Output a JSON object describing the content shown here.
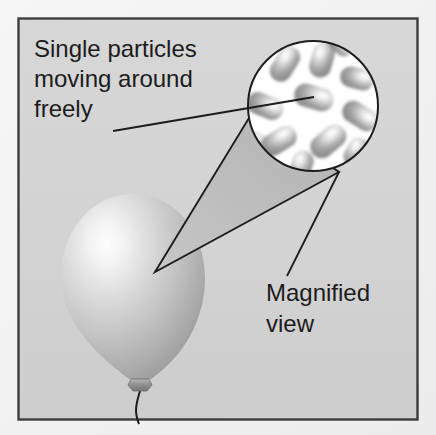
{
  "figure": {
    "background_color": "#f2f2f2",
    "panel_color": "#d4d4d4",
    "border_color": "#3a3a3a",
    "line_color": "#1c1c1c",
    "panel": {
      "x": 18,
      "y": 18,
      "width": 400,
      "height": 402
    }
  },
  "labels": {
    "particles": {
      "name": "particles-caption",
      "lines": [
        "Single particles",
        "moving around",
        "freely"
      ],
      "x": 34,
      "y": 57,
      "font_size": 24,
      "line_height": 30
    },
    "magnified": {
      "name": "magnified-view-caption",
      "lines": [
        "Magnified",
        "view"
      ],
      "x": 266,
      "y": 301,
      "font_size": 24,
      "line_height": 31
    }
  },
  "balloon": {
    "name": "balloon",
    "fill_light": "#fbfbfb",
    "fill_mid": "#c9c9c9",
    "fill_dark": "#8f8f8f",
    "highlight": {
      "cx": 113,
      "cy": 240,
      "r": 95
    },
    "body": {
      "cx": 133,
      "cy": 282,
      "rx": 72,
      "ry": 88
    },
    "knot": {
      "x": 140,
      "y": 383,
      "width": 17,
      "height": 9
    },
    "string_color": "#1c1c1c"
  },
  "magnifier": {
    "name": "magnified-circle",
    "cx": 313,
    "cy": 106,
    "r": 66,
    "fill": "#ffffff",
    "stroke": "#1c1c1c",
    "stroke_width": 2,
    "particle_count": 12,
    "particle_shape": "diatomic-capsule",
    "particles": [
      {
        "cx": 285,
        "cy": 64,
        "len": 30,
        "w": 21,
        "angle": -58
      },
      {
        "cx": 322,
        "cy": 60,
        "len": 29,
        "w": 21,
        "angle": -74
      },
      {
        "cx": 357,
        "cy": 78,
        "len": 27,
        "w": 21,
        "angle": 14
      },
      {
        "cx": 265,
        "cy": 106,
        "len": 30,
        "w": 21,
        "angle": 22
      },
      {
        "cx": 314,
        "cy": 97,
        "len": 32,
        "w": 22,
        "angle": 16
      },
      {
        "cx": 360,
        "cy": 116,
        "len": 30,
        "w": 21,
        "angle": 32
      },
      {
        "cx": 279,
        "cy": 141,
        "len": 30,
        "w": 21,
        "angle": -32
      },
      {
        "cx": 328,
        "cy": 141,
        "len": 32,
        "w": 22,
        "angle": -40
      },
      {
        "cx": 301,
        "cy": 166,
        "len": 26,
        "w": 20,
        "angle": -72
      },
      {
        "cx": 356,
        "cy": 152,
        "len": 24,
        "w": 19,
        "angle": -60
      },
      {
        "cx": 253,
        "cy": 141,
        "len": 22,
        "w": 18,
        "angle": -20
      },
      {
        "cx": 341,
        "cy": 45,
        "len": 20,
        "w": 17,
        "angle": 40
      }
    ]
  },
  "cone": {
    "name": "magnifier-cone",
    "apex": {
      "x": 155,
      "y": 272
    },
    "top": {
      "x": 252,
      "y": 113
    },
    "bottom": {
      "x": 339,
      "y": 172
    },
    "fill": "#bdbdbd",
    "stroke": "#1c1c1c"
  },
  "leader_lines": [
    {
      "name": "particles-leader-line",
      "from": {
        "x": 113,
        "y": 131
      },
      "to": {
        "x": 314,
        "y": 97
      }
    },
    {
      "name": "magnified-leader-line",
      "from": {
        "x": 287,
        "y": 276
      },
      "to": {
        "x": 339,
        "y": 172
      }
    }
  ]
}
